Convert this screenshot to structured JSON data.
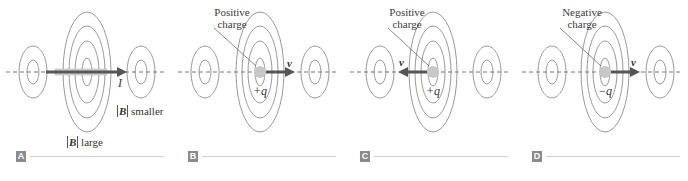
{
  "figure": {
    "colors": {
      "field_lines": "#9a9a9a",
      "axis_dash": "#777777",
      "arrow": "#555555",
      "charge": "#c8c8c8",
      "badge_bg": "#8a8a8a",
      "rule": "#cfcfcf"
    },
    "panels": [
      {
        "id": "A",
        "badge": "A",
        "current_label": "I",
        "b_large_label": "large",
        "b_smaller_label": "smaller",
        "b_symbol": "B",
        "arrow_direction": "right"
      },
      {
        "id": "B",
        "badge": "B",
        "callout_line1": "Positive",
        "callout_line2": "charge",
        "charge_label": "+q",
        "velocity_label": "v",
        "arrow_direction": "right"
      },
      {
        "id": "C",
        "badge": "C",
        "callout_line1": "Positive",
        "callout_line2": "charge",
        "charge_label": "+q",
        "velocity_label": "v",
        "arrow_direction": "left"
      },
      {
        "id": "D",
        "badge": "D",
        "callout_line1": "Negative",
        "callout_line2": "charge",
        "charge_label": "−q",
        "velocity_label": "v",
        "arrow_direction": "right"
      }
    ]
  }
}
